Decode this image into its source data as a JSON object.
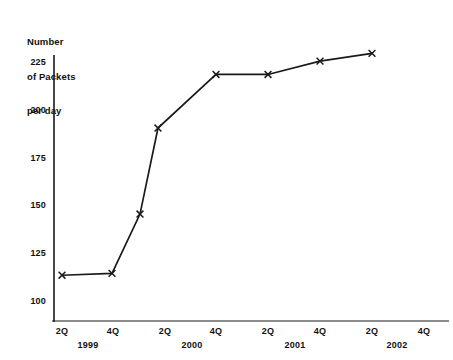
{
  "chart_data": {
    "type": "line",
    "title": "Number of Packets per day",
    "title_lines": [
      "Number",
      "of Packets",
      "per day"
    ],
    "xlabel": "",
    "ylabel": "Number of Packets per day",
    "grid": false,
    "legend": "none",
    "ylim": [
      100,
      225
    ],
    "yticks": [
      225,
      200,
      175,
      150,
      125,
      100
    ],
    "ytick_labels": [
      "225",
      "200",
      "175",
      "150",
      "125",
      "100"
    ],
    "xticks": [
      "2Q",
      "4Q",
      "2Q",
      "4Q",
      "2Q",
      "4Q",
      "2Q",
      "4Q"
    ],
    "xtick_labels": [
      "2Q",
      "4Q",
      "2Q",
      "4Q",
      "2Q",
      "4Q",
      "2Q",
      "4Q"
    ],
    "year_labels": [
      "1999",
      "2000",
      "2001",
      "2002"
    ],
    "marker": "x",
    "line_color": "#1a1a1a",
    "categories": [
      "2Q 1999",
      "4Q 1999",
      "1Q 2000",
      "2Q 2000",
      "4Q 2000",
      "2Q 2001",
      "4Q 2001",
      "2Q 2002"
    ],
    "values": [
      114,
      115,
      146,
      191,
      219,
      219,
      226,
      230
    ],
    "points": [
      {
        "label": "2Q 1999",
        "x": 62,
        "y": 114
      },
      {
        "label": "4Q 1999",
        "x": 112,
        "y": 115
      },
      {
        "label": "1Q 2000",
        "x": 140,
        "y": 146
      },
      {
        "label": "2Q 2000",
        "x": 158,
        "y": 191
      },
      {
        "label": "4Q 2000",
        "x": 216,
        "y": 219
      },
      {
        "label": "2Q 2001",
        "x": 268,
        "y": 219
      },
      {
        "label": "4Q 2001",
        "x": 320,
        "y": 226
      },
      {
        "label": "2Q 2002",
        "x": 372,
        "y": 230
      }
    ]
  },
  "axis": {
    "y_title_line1": "Number",
    "y_title_line2": "of Packets",
    "y_title_line3": "per day"
  },
  "yticks": [
    {
      "label": "225",
      "top": 57
    },
    {
      "label": "200",
      "top": 105
    },
    {
      "label": "175",
      "top": 153
    },
    {
      "label": "150",
      "top": 200
    },
    {
      "label": "125",
      "top": 248
    },
    {
      "label": "100",
      "top": 296
    }
  ],
  "xticks": [
    {
      "label": "2Q",
      "left": 45
    },
    {
      "label": "4Q",
      "left": 96
    },
    {
      "label": "2Q",
      "left": 148
    },
    {
      "label": "4Q",
      "left": 199
    },
    {
      "label": "2Q",
      "left": 251
    },
    {
      "label": "4Q",
      "left": 303
    },
    {
      "label": "2Q",
      "left": 355
    },
    {
      "label": "4Q",
      "left": 407
    }
  ],
  "years": [
    {
      "label": "1999",
      "left": 68
    },
    {
      "label": "2000",
      "left": 172
    },
    {
      "label": "2001",
      "left": 275
    },
    {
      "label": "2002",
      "left": 377
    }
  ]
}
